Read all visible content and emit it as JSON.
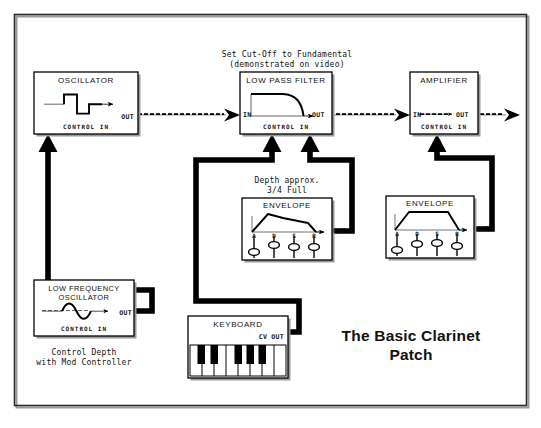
{
  "diagram": {
    "title_line1": "The Basic Clarinet",
    "title_line2": "Patch",
    "frame": {
      "name": "outer-border"
    }
  },
  "annotations": {
    "filter_note_line1": "Set Cut-Off to Fundamental",
    "filter_note_line2": "(demonstrated on video)",
    "depth_note_line1": "Depth approx.",
    "depth_note_line2": "3/4 Full",
    "lfo_note_line1": "Control Depth",
    "lfo_note_line2": "with Mod Controller"
  },
  "modules": {
    "oscillator": {
      "name": "OSCILLATOR",
      "waveform": "square-wave",
      "out_label": "OUT",
      "control_in_label": "CONTROL IN"
    },
    "low_pass_filter": {
      "name": "LOW PASS FILTER",
      "waveform": "lowpass-curve",
      "in_label": "IN",
      "out_label": "OUT",
      "control_in_label": "CONTROL IN"
    },
    "amplifier": {
      "name": "AMPLIFIER",
      "in_label": "IN",
      "out_label": "OUT",
      "control_in_label": "CONTROL IN"
    },
    "envelope_filter": {
      "name": "ENVELOPE",
      "out_label": "OUT",
      "shape": "attack-decay-sustain-release",
      "stages": [
        "A",
        "D",
        "S",
        "R"
      ],
      "slider_values": [
        0.18,
        0.62,
        0.5,
        0.5
      ]
    },
    "envelope_amp": {
      "name": "ENVELOPE",
      "out_label": "OUT",
      "shape": "trapezoid",
      "stages": [
        "A",
        "D",
        "S",
        "R"
      ],
      "slider_values": [
        0.12,
        0.52,
        0.55,
        0.5
      ]
    },
    "low_frequency_oscillator": {
      "name_line1": "LOW FREQUENCY",
      "name_line2": "OSCILLATOR",
      "waveform": "sine-wave",
      "out_label": "OUT",
      "control_in_label": "CONTROL IN"
    },
    "keyboard": {
      "name": "KEYBOARD",
      "cv_out_label": "CV OUT",
      "white_keys": 8,
      "black_keys": 5
    }
  },
  "connections": [
    {
      "id": "osc-to-filter",
      "type": "audio",
      "from": "oscillator.out",
      "to": "low_pass_filter.in"
    },
    {
      "id": "filter-to-amp",
      "type": "audio",
      "from": "low_pass_filter.out",
      "to": "amplifier.in"
    },
    {
      "id": "amp-to-output",
      "type": "audio",
      "from": "amplifier.out",
      "to": "main-output"
    },
    {
      "id": "lfo-to-osc",
      "type": "control",
      "from": "low_frequency_oscillator.out",
      "to": "oscillator.control_in"
    },
    {
      "id": "keyboard-to-filter",
      "type": "control",
      "from": "keyboard.cv_out",
      "to": "low_pass_filter.control_in"
    },
    {
      "id": "env1-to-filter",
      "type": "control",
      "from": "envelope_filter.out",
      "to": "low_pass_filter.control_in"
    },
    {
      "id": "env2-to-amp",
      "type": "control",
      "from": "envelope_amp.out",
      "to": "amplifier.control_in"
    }
  ],
  "colors": {
    "ink": "#000000",
    "paper": "#ffffff",
    "border": "#3a3a3a",
    "shadow": "#9a9a9a"
  }
}
